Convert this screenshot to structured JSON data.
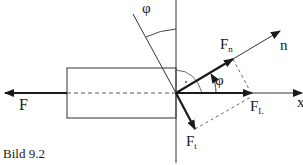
{
  "figure": {
    "caption": "Bild 9.2",
    "labels": {
      "force_F": "F",
      "force_Fn": "F",
      "force_Fn_sub": "n",
      "force_FL": "F",
      "force_FL_sub": "L",
      "force_Ft": "F",
      "force_Ft_sub": "t",
      "axis_n": "n",
      "axis_x": "x",
      "angle_top": "φ",
      "angle_inner": "φ"
    },
    "colors": {
      "ink": "#1a1a1a",
      "background": "#ffffff"
    }
  }
}
